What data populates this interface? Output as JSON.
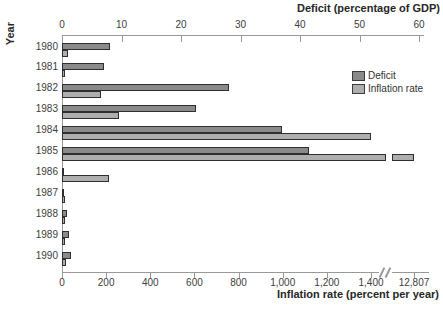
{
  "chart_data": {
    "type": "bar",
    "orientation": "horizontal",
    "year_axis_label": "Year",
    "deficit_axis": {
      "title": "Deficit (percentage of GDP)",
      "ticks": [
        0,
        10,
        20,
        30,
        40,
        50,
        60
      ],
      "range": [
        0,
        60
      ],
      "position": "top"
    },
    "inflation_axis": {
      "title": "Inflation rate (percent per year)",
      "ticks": [
        0,
        200,
        400,
        600,
        800,
        1000,
        1200,
        1400
      ],
      "tick_labels": [
        "0",
        "200",
        "400",
        "600",
        "800",
        "1,000",
        "1,200",
        "1,400"
      ],
      "axis_break": true,
      "overflow_value": 12807,
      "overflow_tick_label": "12,807",
      "range": [
        0,
        1400
      ],
      "position": "bottom"
    },
    "categories": [
      1980,
      1981,
      1982,
      1983,
      1984,
      1985,
      1986,
      1987,
      1988,
      1989,
      1990
    ],
    "series": [
      {
        "name": "Deficit",
        "axis": "deficit",
        "color": "#8a8a8a",
        "values": [
          8,
          7,
          28,
          22.5,
          37,
          41.5,
          0.3,
          0.4,
          0.8,
          1.2,
          1.5
        ]
      },
      {
        "name": "Inflation rate",
        "axis": "inflation",
        "color": "#aeaeae",
        "values": [
          25,
          15,
          175,
          260,
          1400,
          12807,
          215,
          13,
          15,
          15,
          16
        ]
      }
    ],
    "legend": {
      "position": "upper-right"
    },
    "grid": "off",
    "colors": {
      "bar_border": "#2f2f2f",
      "axis_line": "#999999",
      "text": "#3d3d3d"
    }
  }
}
